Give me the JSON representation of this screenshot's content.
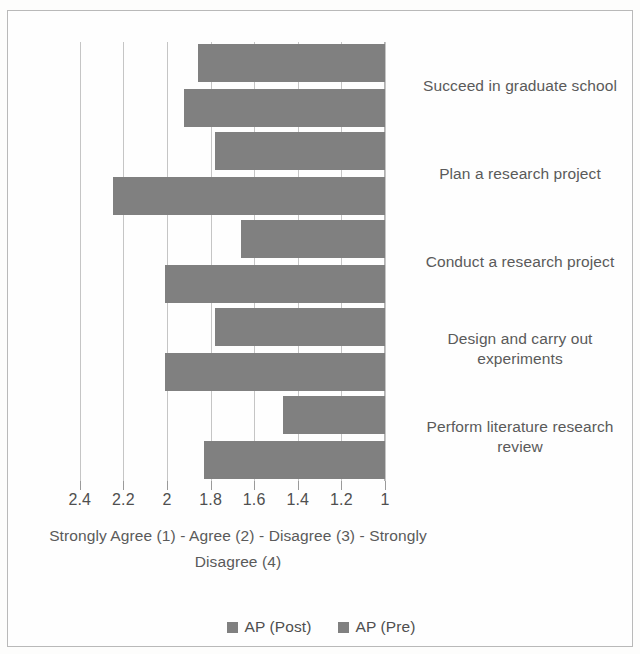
{
  "chart_data": {
    "type": "bar",
    "orientation": "horizontal",
    "title": "",
    "xlabel": "Strongly Agree (1) - Agree (2) - Disagree (3) - Strongly Disagree (4)",
    "ylabel": "",
    "xlim": [
      2.5,
      1.0
    ],
    "x_axis_reversed": true,
    "grid": true,
    "legend_position": "bottom",
    "tick_labels": [
      "2.4",
      "2.2",
      "2",
      "1.8",
      "1.6",
      "1.4",
      "1.2",
      "1"
    ],
    "tick_values": [
      2.4,
      2.2,
      2.0,
      1.8,
      1.6,
      1.4,
      1.2,
      1.0
    ],
    "categories": [
      "Succeed in graduate school",
      "Plan a research project",
      "Conduct a research project",
      "Design and carry out experiments",
      "Perform literature research review"
    ],
    "series": [
      {
        "name": "AP (Post)",
        "color": "#808080",
        "values": [
          1.86,
          1.78,
          1.66,
          1.78,
          1.47
        ]
      },
      {
        "name": "AP (Pre)",
        "color": "#808080",
        "values": [
          1.92,
          2.25,
          2.01,
          2.01,
          1.83
        ]
      }
    ]
  },
  "axis_title_lines": [
    "Strongly Agree (1) - Agree (2) - Disagree (3) - Strongly",
    "Disagree (4)"
  ],
  "category_label_lines": [
    [
      "Succeed in graduate school"
    ],
    [
      "Plan a research project"
    ],
    [
      "Conduct a research project"
    ],
    [
      "Design and carry out",
      "experiments"
    ],
    [
      "Perform literature research",
      "review"
    ]
  ],
  "legend": {
    "items": [
      {
        "label": "AP (Post)",
        "marker": "square-marker",
        "color": "#808080"
      },
      {
        "label": "AP (Pre)",
        "marker": "square-marker",
        "color": "#808080"
      }
    ]
  },
  "colors": {
    "bar_fill": "#808080",
    "gridline": "#c5c5c5",
    "text": "#5a5a5a",
    "frame_border": "#b9b9b9",
    "background": "#fefefe"
  }
}
